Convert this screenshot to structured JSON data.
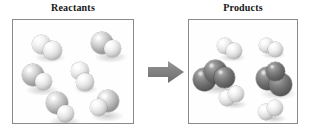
{
  "figure": {
    "type": "molecular-reaction-diagram",
    "background_color": "#ffffff",
    "box_border_color": "#8a8a8a",
    "arrow_color": "#808080",
    "title_color": "#151515"
  },
  "panels": [
    {
      "id": "reactants",
      "title": "Reactants",
      "box": {
        "x": 12,
        "y": 19,
        "width": 122,
        "height": 105
      },
      "molecules": [
        {
          "name": "reactant-molecule-1",
          "atoms": [
            {
              "cx": 40,
              "cy": 41,
              "r": 9.5,
              "shade": "light"
            },
            {
              "cx": 51,
              "cy": 47,
              "r": 9.5,
              "shade": "light"
            }
          ]
        },
        {
          "name": "reactant-molecule-2",
          "atoms": [
            {
              "cx": 101,
              "cy": 40,
              "r": 11.0,
              "shade": "mid"
            },
            {
              "cx": 111,
              "cy": 45,
              "r": 8.5,
              "shade": "light"
            }
          ]
        },
        {
          "name": "reactant-molecule-3",
          "atoms": [
            {
              "cx": 32,
              "cy": 72,
              "r": 11.0,
              "shade": "mid"
            },
            {
              "cx": 42,
              "cy": 78,
              "r": 8.5,
              "shade": "light"
            }
          ]
        },
        {
          "name": "reactant-molecule-4",
          "atoms": [
            {
              "cx": 79,
              "cy": 68,
              "r": 9.0,
              "shade": "light"
            },
            {
              "cx": 84,
              "cy": 79,
              "r": 9.0,
              "shade": "light"
            }
          ]
        },
        {
          "name": "reactant-molecule-5",
          "atoms": [
            {
              "cx": 56,
              "cy": 100,
              "r": 11.0,
              "shade": "mid"
            },
            {
              "cx": 64,
              "cy": 110,
              "r": 8.5,
              "shade": "light"
            }
          ]
        },
        {
          "name": "reactant-molecule-6",
          "atoms": [
            {
              "cx": 107,
              "cy": 98,
              "r": 11.0,
              "shade": "mid"
            },
            {
              "cx": 97,
              "cy": 104,
              "r": 8.5,
              "shade": "light"
            }
          ]
        }
      ]
    },
    {
      "id": "products",
      "title": "Products",
      "box": {
        "x": 188,
        "y": 19,
        "width": 110,
        "height": 105
      },
      "molecules": [
        {
          "name": "product-molecule-1",
          "atoms": [
            {
              "cx": 224,
              "cy": 43,
              "r": 8.0,
              "shade": "light"
            },
            {
              "cx": 233,
              "cy": 48,
              "r": 8.0,
              "shade": "light"
            }
          ]
        },
        {
          "name": "product-molecule-2",
          "atoms": [
            {
              "cx": 265,
              "cy": 42,
              "r": 7.5,
              "shade": "light"
            },
            {
              "cx": 274,
              "cy": 46,
              "r": 7.5,
              "shade": "light"
            }
          ]
        },
        {
          "name": "product-molecule-3",
          "atoms": [
            {
              "cx": 203,
              "cy": 76,
              "r": 11.5,
              "shade": "dark"
            },
            {
              "cx": 214,
              "cy": 68,
              "r": 11.5,
              "shade": "dark"
            },
            {
              "cx": 223,
              "cy": 74,
              "r": 10.5,
              "shade": "dark"
            }
          ]
        },
        {
          "name": "product-molecule-4",
          "atoms": [
            {
              "cx": 266,
              "cy": 75,
              "r": 11.5,
              "shade": "dark"
            },
            {
              "cx": 279,
              "cy": 81,
              "r": 11.5,
              "shade": "dark"
            },
            {
              "cx": 274,
              "cy": 68,
              "r": 9.5,
              "shade": "dark"
            }
          ]
        },
        {
          "name": "product-molecule-5",
          "atoms": [
            {
              "cx": 226,
              "cy": 95,
              "r": 8.0,
              "shade": "light"
            },
            {
              "cx": 235,
              "cy": 91,
              "r": 8.0,
              "shade": "light"
            }
          ]
        },
        {
          "name": "product-molecule-6",
          "atoms": [
            {
              "cx": 265,
              "cy": 109,
              "r": 8.0,
              "shade": "light"
            },
            {
              "cx": 274,
              "cy": 105,
              "r": 8.0,
              "shade": "light"
            }
          ]
        }
      ]
    }
  ],
  "arrow": {
    "name": "reaction-arrow",
    "x": 148,
    "y": 60,
    "width": 36,
    "height": 24,
    "direction": "right",
    "color": "#808080"
  }
}
